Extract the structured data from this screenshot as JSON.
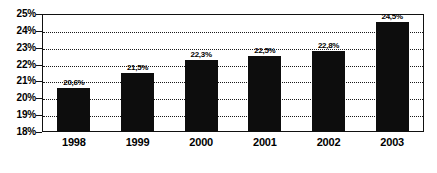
{
  "chart_data": {
    "type": "bar",
    "title": "",
    "subtitle": "",
    "xlabel": "",
    "ylabel": "",
    "categories": [
      "1998",
      "1999",
      "2000",
      "2001",
      "2002",
      "2003"
    ],
    "values": [
      20.6,
      21.5,
      22.3,
      22.5,
      22.8,
      24.5
    ],
    "data_labels": [
      "20,6%",
      "21,5%",
      "22,3%",
      "22,5%",
      "22,8%",
      "24,5%"
    ],
    "ylim": [
      18,
      25
    ],
    "ytick_labels": [
      "25%",
      "24%",
      "23%",
      "22%",
      "21%",
      "20%",
      "19%",
      "18%"
    ],
    "ytick_values": [
      25,
      24,
      23,
      22,
      21,
      20,
      19,
      18
    ],
    "grid": true,
    "grid_style": "dotted",
    "legend": false,
    "legend_position": "none",
    "series": [
      {
        "name": "",
        "values": [
          20.6,
          21.5,
          22.3,
          22.5,
          22.8,
          24.5
        ]
      }
    ],
    "colors": {
      "bar": "#0d0d0d",
      "axis": "#111111",
      "grid": "#1a1a1a",
      "text": "#000000",
      "background": "#ffffff"
    }
  }
}
